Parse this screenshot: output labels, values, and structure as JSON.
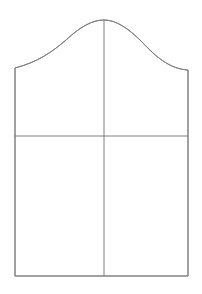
{
  "document": {
    "title": "Pattern Draft",
    "kind": "garment-pattern-block",
    "background_color": "#ffffff",
    "canvas": {
      "width": 202,
      "height": 294
    }
  },
  "style": {
    "outline_color": "#808080",
    "outline_width": 1,
    "guide_color": "#808080",
    "guide_width": 1,
    "fill_color": "none"
  },
  "geometry": {
    "left_edge_x": 15,
    "right_edge_x": 188,
    "bottom_y": 276,
    "left_shoulder_y": 68,
    "right_shoulder_y": 70,
    "apex_x": 104,
    "apex_y": 20,
    "center_line_x": 104,
    "balance_line_y": 136
  },
  "paths": {
    "outline": "M 15 68 C 38 62 52 52 66 40 C 80 27 92 20 104 20 C 116 20 128 28 142 42 C 156 57 170 69 188 70 L 188 276 L 15 276 Z",
    "cap_curve": "M 15 68 C 38 62 52 52 66 40 C 80 27 92 20 104 20 C 116 20 128 28 142 42 C 156 57 170 69 188 70",
    "left_side": "M 15 68 L 15 276",
    "right_side": "M 188 70 L 188 276",
    "hem_line": "M 15 276 L 188 276",
    "center_grainline": "M 104 20 L 104 276",
    "balance_line": "M 15 136 L 188 136"
  },
  "labels": {
    "outline_name": "pattern-outline",
    "cap_curve_name": "cap-curve",
    "center_line_name": "center-grainline",
    "balance_line_name": "balance-line",
    "hem_line_name": "hem-line",
    "left_side_name": "left-side-seam",
    "right_side_name": "right-side-seam"
  },
  "chart_data": {
    "type": "line",
    "title": "",
    "xlabel": "",
    "ylabel": "",
    "xlim": [
      0,
      202
    ],
    "ylim": [
      294,
      0
    ],
    "grid": false,
    "legend": "none",
    "series": [
      {
        "name": "cap-curve",
        "x": [
          15,
          38,
          52,
          66,
          80,
          92,
          104,
          116,
          128,
          142,
          156,
          170,
          188
        ],
        "y": [
          68,
          62,
          52,
          40,
          27,
          21,
          20,
          20,
          28,
          42,
          57,
          69,
          70
        ]
      },
      {
        "name": "left-side-seam",
        "x": [
          15,
          15
        ],
        "y": [
          68,
          276
        ]
      },
      {
        "name": "right-side-seam",
        "x": [
          188,
          188
        ],
        "y": [
          70,
          276
        ]
      },
      {
        "name": "hem-line",
        "x": [
          15,
          188
        ],
        "y": [
          276,
          276
        ]
      },
      {
        "name": "center-grainline",
        "x": [
          104,
          104
        ],
        "y": [
          20,
          276
        ]
      },
      {
        "name": "balance-line",
        "x": [
          15,
          188
        ],
        "y": [
          136,
          136
        ]
      }
    ]
  }
}
